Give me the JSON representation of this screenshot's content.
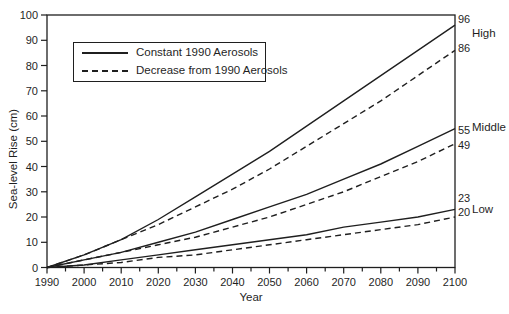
{
  "figure": {
    "background": "#ffffff",
    "ink_color": "#1f1f1f"
  },
  "chart_data": {
    "type": "line",
    "title": "",
    "xlabel": "Year",
    "ylabel": "Sea-level Rise (cm)",
    "xlim": [
      1990,
      2100
    ],
    "ylim": [
      0,
      100
    ],
    "x_tick_step": 10,
    "x_minor_tick_step": 5,
    "y_tick_step": 10,
    "grid": false,
    "legend": {
      "position": "top-left",
      "entries": [
        {
          "label": "Constant 1990 Aerosols",
          "style": "solid"
        },
        {
          "label": "Decrease from 1990 Aerosols",
          "style": "dashed"
        }
      ]
    },
    "x": [
      1990,
      2000,
      2010,
      2020,
      2030,
      2040,
      2050,
      2060,
      2070,
      2080,
      2090,
      2100
    ],
    "series": [
      {
        "id": "high-constant",
        "name": "High - Constant 1990 Aerosols",
        "scenario": "High",
        "style": "solid",
        "end_label": "96",
        "values": [
          0,
          5,
          11,
          19,
          28,
          37,
          46,
          56,
          66,
          76,
          86,
          96
        ]
      },
      {
        "id": "high-decrease",
        "name": "High - Decrease from 1990 Aerosols",
        "scenario": "High",
        "style": "dashed",
        "end_label": "86",
        "values": [
          0,
          5,
          11,
          17,
          24,
          31,
          39,
          48,
          57,
          66,
          76,
          86
        ]
      },
      {
        "id": "middle-constant",
        "name": "Middle - Constant 1990 Aerosols",
        "scenario": "Middle",
        "style": "solid",
        "end_label": "55",
        "values": [
          0,
          3,
          6,
          10,
          14,
          19,
          24,
          29,
          35,
          41,
          48,
          55
        ]
      },
      {
        "id": "middle-decrease",
        "name": "Middle - Decrease from 1990 Aerosols",
        "scenario": "Middle",
        "style": "dashed",
        "end_label": "49",
        "values": [
          0,
          3,
          6,
          9,
          12,
          16,
          20,
          25,
          30,
          36,
          42,
          49
        ]
      },
      {
        "id": "low-constant",
        "name": "Low - Constant 1990 Aerosols",
        "scenario": "Low",
        "style": "solid",
        "end_label": "23",
        "values": [
          0,
          1,
          3,
          5,
          7,
          9,
          11,
          13,
          16,
          18,
          20,
          23
        ]
      },
      {
        "id": "low-decrease",
        "name": "Low - Decrease from 1990 Aerosols",
        "scenario": "Low",
        "style": "dashed",
        "end_label": "20",
        "values": [
          0,
          1,
          2,
          4,
          5,
          7,
          9,
          11,
          13,
          15,
          17,
          20
        ]
      }
    ],
    "scenario_labels": [
      {
        "id": "high",
        "text": "High",
        "at_value": 93
      },
      {
        "id": "middle",
        "text": "Middle",
        "at_value": 55.5
      },
      {
        "id": "low",
        "text": "Low",
        "at_value": 23
      }
    ]
  }
}
